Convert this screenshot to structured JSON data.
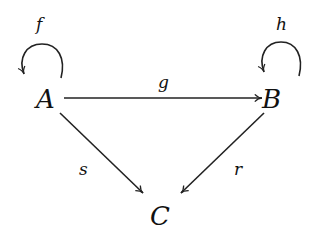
{
  "diagram": {
    "type": "commutative-diagram",
    "nodes": [
      {
        "id": "A",
        "label": "A",
        "x": 47,
        "y": 98
      },
      {
        "id": "B",
        "label": "B",
        "x": 272,
        "y": 98
      },
      {
        "id": "C",
        "label": "C",
        "x": 160,
        "y": 215
      }
    ],
    "edges": [
      {
        "from": "A",
        "to": "A",
        "label": "f",
        "kind": "loop"
      },
      {
        "from": "B",
        "to": "B",
        "label": "h",
        "kind": "loop"
      },
      {
        "from": "A",
        "to": "B",
        "label": "g"
      },
      {
        "from": "A",
        "to": "C",
        "label": "s"
      },
      {
        "from": "B",
        "to": "C",
        "label": "r"
      }
    ]
  },
  "labels": {
    "A": "A",
    "B": "B",
    "C": "C",
    "f": "f",
    "h": "h",
    "g": "g",
    "s": "s",
    "r": "r"
  },
  "colors": {
    "stroke": "#222222",
    "text": "#111111",
    "background": "#ffffff"
  }
}
